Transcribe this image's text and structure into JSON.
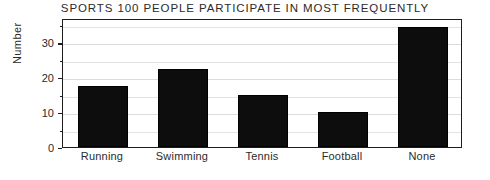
{
  "chart_data": {
    "type": "bar",
    "title": "SPORTS 100 PEOPLE PARTICIPATE IN MOST FREQUENTLY",
    "xlabel": "",
    "ylabel": "Number",
    "categories": [
      "Running",
      "Swimming",
      "Tennis",
      "Football",
      "None"
    ],
    "values": [
      17.5,
      22.5,
      15,
      10,
      34.5
    ],
    "ylim": [
      0,
      37
    ],
    "ytick_labels": [
      "0",
      "10",
      "20",
      "30"
    ],
    "ytick_values": [
      0,
      10,
      20,
      30
    ],
    "minor_tick_step": 5,
    "grid": true,
    "grid_axis": "y",
    "legend": "none",
    "bar_color": "#0d0d0d",
    "background_color": "#ffffff",
    "gridline_color": "#e3e3e3",
    "axis_color": "#1d1d1d"
  }
}
